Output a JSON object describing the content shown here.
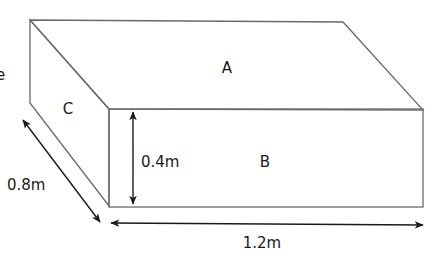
{
  "diagram": {
    "type": "cuboid-3d",
    "cropped_text_fragment": "e",
    "faces": [
      {
        "id": "A",
        "label": "A",
        "position": "top"
      },
      {
        "id": "B",
        "label": "B",
        "position": "front"
      },
      {
        "id": "C",
        "label": "C",
        "position": "side"
      }
    ],
    "dimensions": {
      "height": {
        "label": "0.4m",
        "value": 0.4,
        "unit": "m"
      },
      "depth": {
        "label": "0.8m",
        "value": 0.8,
        "unit": "m"
      },
      "length": {
        "label": "1.2m",
        "value": 1.2,
        "unit": "m"
      }
    },
    "colors": {
      "edge": "#6a6a6a",
      "arrow": "#1a1a1a",
      "text": "#1a1a1a",
      "background": "#ffffff"
    }
  }
}
